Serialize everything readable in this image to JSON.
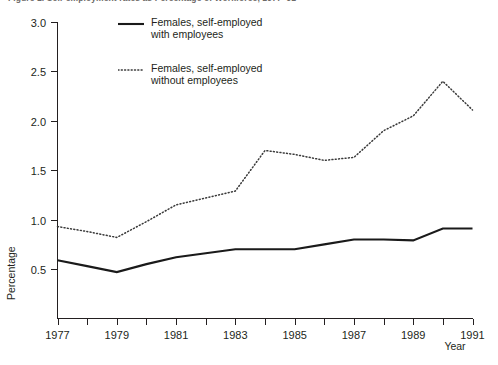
{
  "figure": {
    "title": "Figure 1.  Self-employment rates as Percentage of Workforce, 1977–91",
    "y_axis_title": "Percentage",
    "x_axis_title": "Year"
  },
  "legend": {
    "items": [
      {
        "label": "Females, self-employed\nwith employees",
        "style": "solid",
        "color": "#1a1a1a"
      },
      {
        "label": "Females, self-employed\nwithout employees",
        "style": "dotted",
        "color": "#3a3a3a"
      }
    ]
  },
  "chart_data": {
    "type": "line",
    "title": "Figure 1.  Self-employment rates as Percentage of Workforce, 1977–91",
    "xlabel": "Year",
    "ylabel": "Percentage",
    "xlim": [
      1977,
      1991
    ],
    "ylim": [
      0.0,
      3.0
    ],
    "grid": false,
    "legend_position": "top-center",
    "x": [
      1977,
      1978,
      1979,
      1980,
      1981,
      1982,
      1983,
      1984,
      1985,
      1986,
      1987,
      1988,
      1989,
      1990,
      1991
    ],
    "xticks": [
      1977,
      1979,
      1981,
      1983,
      1985,
      1987,
      1989,
      1991
    ],
    "xtick_labels": [
      "1977",
      "1979",
      "1981",
      "1983",
      "1985",
      "1987",
      "1989",
      "1991"
    ],
    "yticks": [
      0.5,
      1.0,
      1.5,
      2.0,
      2.5,
      3.0
    ],
    "ytick_labels": [
      "0.5",
      "1.0",
      "1.5",
      "2.0",
      "2.5",
      "3.0"
    ],
    "series": [
      {
        "name": "Females, self-employed with employees",
        "style": "solid",
        "color": "#1a1a1a",
        "values": [
          0.59,
          0.53,
          0.47,
          0.55,
          0.62,
          0.66,
          0.7,
          0.7,
          0.7,
          0.75,
          0.8,
          0.8,
          0.79,
          0.91,
          0.91
        ]
      },
      {
        "name": "Females, self-employed without employees",
        "style": "dotted",
        "color": "#3a3a3a",
        "values": [
          0.93,
          0.88,
          0.82,
          0.98,
          1.15,
          1.22,
          1.29,
          1.7,
          1.66,
          1.6,
          1.63,
          1.9,
          2.05,
          2.4,
          2.11
        ]
      }
    ]
  }
}
